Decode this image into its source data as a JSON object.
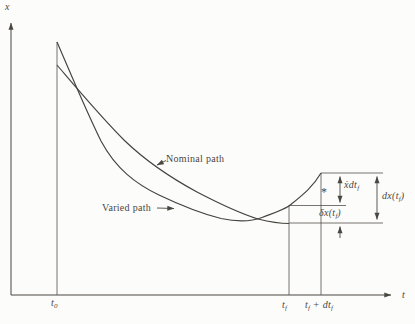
{
  "figure": {
    "background": "#fcfcfb",
    "line_color": "#4a4741",
    "text_color": "#4b473f"
  },
  "axes": {
    "x_label": "x",
    "t_label": "t"
  },
  "tick_labels": {
    "t0_main": "t",
    "t0_sub": "0",
    "tf_main": "t",
    "tf_sub": "f",
    "tfdtf_t1": "t",
    "tfdtf_s1": "f",
    "tfdtf_plus": " + d",
    "tfdtf_t2": "t",
    "tfdtf_s2": "f"
  },
  "curves": {
    "nominal_label": "Nominal path",
    "varied_label": "Varied path",
    "nominal_d": "M 57 65 C 75 86, 100 116, 125 141 C 149 164, 173 179, 197 192 C 220 204, 242 214, 258 219 C 272 222.5, 283 223.5, 289 223.5",
    "varied_d": "M 57 42 C 70 72, 87 113, 101 141 C 116 169, 136 184, 159 195 C 182 206, 203 214, 221 218.5 C 235 221.5, 249 222.5, 262 217.5 C 272 213.5, 281 211, 289 206 C 302 195.5, 313 187, 321 173"
  },
  "annotations": {
    "xdot_main": "ẋdt",
    "xdot_sub": "f",
    "delta_pre": "δx(t",
    "delta_sub": "f",
    "delta_post": ")",
    "dx_pre": "dx(t",
    "dx_sub": "f",
    "dx_post": ")",
    "star": "*"
  }
}
